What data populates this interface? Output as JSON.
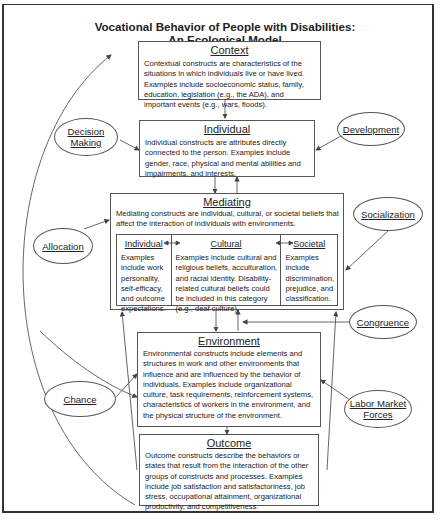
{
  "title": {
    "line1": "Vocational Behavior of People with Disabilities:",
    "line2": "An Ecological Model"
  },
  "boxes": {
    "context": {
      "heading": "Context",
      "text": "Contextual constructs are characteristics of the situations in which individuals live or have lived. Examples include socioeconomic status, family, education, legislation (e.g., the ADA), and important events (e.g., wars, floods)."
    },
    "individual": {
      "heading": "Individual",
      "text": "Individual constructs are attributes directly connected to the person. Examples include gender, race, physical and mental abilities and impairments, and interests."
    },
    "mediating": {
      "heading": "Mediating",
      "text": "Mediating constructs are individual, cultural, or societal beliefs that affect the interaction of individuals with environments.",
      "columns": [
        {
          "heading": "Individual",
          "text": "Examples include work personality, self-efficacy, and outcome expectations."
        },
        {
          "heading": "Cultural",
          "text": "Examples include cultural and religious beliefs, acculturation, and racial identity. Disability-related cultural beliefs could be included in this category (e.g., deaf culture)."
        },
        {
          "heading": "Societal",
          "text": "Examples include discrimination, prejudice, and classification."
        }
      ]
    },
    "environment": {
      "heading": "Environment",
      "text": "Environmental constructs include elements and structures in work and other environments that influence and are influenced by the behavior of individuals. Examples include organizational culture, task requirements, reinforcement systems, characteristics of workers in the environment, and the physical structure of the environment."
    },
    "outcome": {
      "heading": "Outcome",
      "text": "Outcome constructs describe the behaviors or states that result from the interaction of the other groups of constructs and processes. Examples include job satisfaction and satisfactoriness, job stress, occupational attainment, organizational productivity, and competitiveness."
    }
  },
  "processes": {
    "decision_making": {
      "line1": "Decision",
      "line2": "Making"
    },
    "development": "Development",
    "allocation": "Allocation",
    "socialization": "Socialization",
    "congruence": "Congruence",
    "chance": "Chance",
    "labor_market_forces": {
      "line1": "Labor Market",
      "line2": "Forces"
    }
  },
  "colors": {
    "line": "#555555",
    "text": "#222222",
    "background": "#ffffff"
  }
}
